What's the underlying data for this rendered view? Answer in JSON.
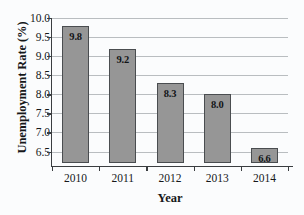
{
  "chart_data": {
    "type": "bar",
    "title": "",
    "xlabel": "Year",
    "ylabel": "Unemployment Rate (%)",
    "categories": [
      "2010",
      "2011",
      "2012",
      "2013",
      "2014"
    ],
    "values": [
      9.8,
      9.2,
      8.3,
      8.0,
      6.6
    ],
    "value_labels": [
      "9.8",
      "9.2",
      "8.3",
      "8.0",
      "6.6"
    ],
    "ylim": [
      6.2,
      10.0
    ],
    "yticks": [
      10.0,
      9.5,
      9.0,
      8.5,
      8.0,
      7.5,
      7.0,
      6.5
    ],
    "ytick_labels": [
      "10.0",
      "9.5",
      "9.0",
      "8.5",
      "8.0",
      "7.5",
      "7.0",
      "6.5"
    ],
    "grid": true,
    "grid_axis": "y",
    "legend": false,
    "bar_color": "#969696",
    "bar_edge_color": "#4a4d50",
    "grid_color": "#b9bdc0",
    "axis_color": "#3a3d40",
    "background_color": "#fbfcfd"
  }
}
